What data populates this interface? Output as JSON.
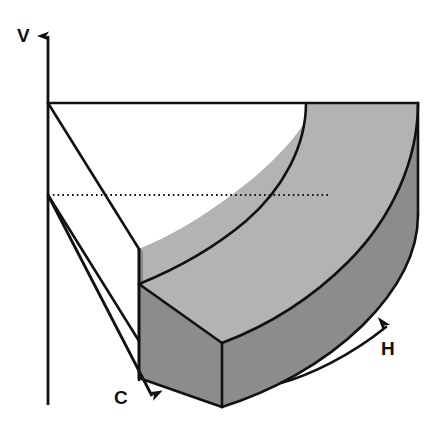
{
  "figure": {
    "kind": "3d-axonometric-diagram",
    "title_text": "",
    "background_color": "#ffffff",
    "line_color": "#111111",
    "fill_top_color": "#b3b3b3",
    "fill_front_color": "#8c8c8c",
    "axes": [
      {
        "id": "v",
        "label": "V",
        "name": "vertical-axis",
        "direction": "up",
        "arrow": true,
        "label_x": 17,
        "label_y": 26
      },
      {
        "id": "c",
        "label": "C",
        "name": "cross-range-axis",
        "direction": "down-right",
        "arrow": true,
        "label_x": 114,
        "label_y": 388
      },
      {
        "id": "h",
        "label": "H",
        "name": "horizontal-arc-axis",
        "direction": "curved-up-right",
        "arrow": true,
        "label_x": 381,
        "label_y": 339
      }
    ],
    "elements": [
      {
        "name": "wireframe-box",
        "style": "outline",
        "fill": "none"
      },
      {
        "name": "reference-dotted-line",
        "style": "dotted",
        "fill": "none"
      },
      {
        "name": "curved-band-top-face",
        "style": "shaded",
        "fill": "#b3b3b3"
      },
      {
        "name": "curved-band-outer-face",
        "style": "shaded",
        "fill": "#8c8c8c"
      },
      {
        "name": "curved-band-left-end-face",
        "style": "shaded",
        "fill": "#8c8c8c"
      }
    ]
  }
}
